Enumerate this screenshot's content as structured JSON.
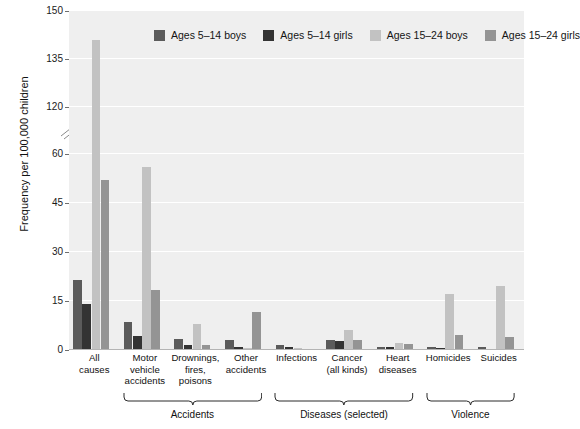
{
  "chart_data": {
    "type": "bar",
    "title": "",
    "xlabel": "",
    "ylabel": "Frequency per 100,000 children",
    "ylim": [
      0,
      150
    ],
    "y_ticks": [
      0,
      15,
      30,
      45,
      60,
      120,
      135,
      150
    ],
    "y_axis_break": {
      "from": 60,
      "to": 120,
      "present": true
    },
    "grid": true,
    "legend_position": "top-inside",
    "categories": [
      "All\ncauses",
      "Motor\nvehicle\naccidents",
      "Drownings,\nfires,\npoisons",
      "Other\naccidents",
      "Infections",
      "Cancer\n(all kinds)",
      "Heart\ndiseases",
      "Homicides",
      "Suicides"
    ],
    "series": [
      {
        "name": "Ages 5–14 boys",
        "color": "#5b5b5b",
        "values": [
          21.5,
          8.6,
          3.5,
          3.0,
          1.5,
          3.2,
          1.0,
          0.8,
          0.8
        ]
      },
      {
        "name": "Ages 5–14 girls",
        "color": "#333333",
        "values": [
          14.0,
          4.2,
          1.4,
          0.9,
          0.8,
          2.7,
          0.9,
          0.5,
          0.2
        ]
      },
      {
        "name": "Ages 15–24 boys",
        "color": "#c2c2c2",
        "values": [
          141.0,
          56.0,
          8.0,
          0.6,
          0.5,
          6.0,
          2.3,
          17.2,
          19.5
        ]
      },
      {
        "name": "Ages 15–24 girls",
        "color": "#949494",
        "values": [
          52.0,
          18.5,
          1.6,
          11.5,
          0.3,
          3.0,
          1.7,
          4.5,
          4.0
        ]
      }
    ],
    "group_brackets": [
      {
        "label": "Accidents",
        "from_category": 1,
        "to_category": 3
      },
      {
        "label": "Diseases (selected)",
        "from_category": 4,
        "to_category": 6
      },
      {
        "label": "Violence",
        "from_category": 7,
        "to_category": 8
      }
    ]
  },
  "colors": {
    "plot_background": "#efefef",
    "gridline": "#ffffff",
    "text": "#111111",
    "axis": "#6e6e6e"
  }
}
